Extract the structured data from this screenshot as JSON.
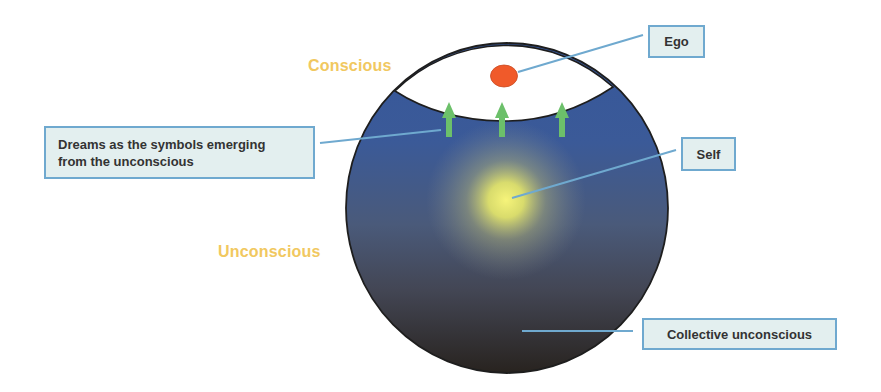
{
  "diagram": {
    "zones": {
      "conscious": "Conscious",
      "unconscious": "Unconscious"
    },
    "callouts": {
      "ego": "Ego",
      "self": "Self",
      "dreams_line1": "Dreams as the symbols emerging",
      "dreams_line2": "from the unconscious",
      "collective": "Collective unconscious"
    },
    "elements": {
      "psyche_circle": "psyche sphere",
      "conscious_cap": "conscious region",
      "ego_marker": "ego",
      "self_glow": "self",
      "dream_arrows": [
        "arrow-1",
        "arrow-2",
        "arrow-3"
      ]
    },
    "colors": {
      "zone_label": "#f1c860",
      "callout_fill": "#e3efef",
      "callout_border": "#6fa9cf",
      "leader_line": "#6fa9cf",
      "sphere_top": "#3b5a98",
      "sphere_bottom": "#2a2624",
      "ego": "#f05a2a",
      "self_glow": "#f4f27a",
      "arrow": "#6cc06a"
    }
  }
}
